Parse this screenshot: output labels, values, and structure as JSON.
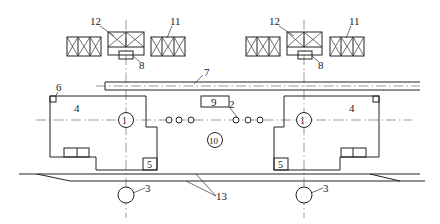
{
  "diagram": {
    "type": "layout-plan",
    "labels": {
      "machine_center": "1",
      "small_circles": "2",
      "lower_circle": "3",
      "machine_body": "4",
      "corner_box": "5",
      "corner_marker": "6",
      "conveyor": "7",
      "small_box_under_bin": "8",
      "center_box": "9",
      "center_circle": "10",
      "side_bins": "11",
      "center_bin": "12",
      "bottom_lines": "13"
    }
  }
}
